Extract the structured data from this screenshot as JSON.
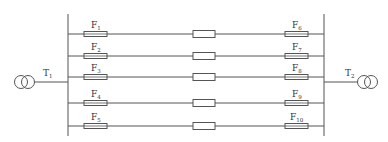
{
  "diagram": {
    "type": "electrical-single-line",
    "colors": {
      "line": "#555555",
      "text": "#333333",
      "background": "#ffffff"
    },
    "transformers": [
      {
        "id": "T1",
        "label": "T",
        "sub": "1",
        "side": "left"
      },
      {
        "id": "T2",
        "label": "T",
        "sub": "2",
        "side": "right"
      }
    ],
    "feeders": [
      {
        "left_fuse": {
          "label": "F",
          "sub": "1"
        },
        "right_fuse": {
          "label": "F",
          "sub": "6"
        }
      },
      {
        "left_fuse": {
          "label": "F",
          "sub": "2"
        },
        "right_fuse": {
          "label": "F",
          "sub": "7"
        }
      },
      {
        "left_fuse": {
          "label": "F",
          "sub": "3"
        },
        "right_fuse": {
          "label": "F",
          "sub": "8"
        }
      },
      {
        "left_fuse": {
          "label": "F",
          "sub": "4"
        },
        "right_fuse": {
          "label": "F",
          "sub": "9"
        }
      },
      {
        "left_fuse": {
          "label": "F",
          "sub": "5"
        },
        "right_fuse": {
          "label": "F",
          "sub": "10"
        }
      }
    ]
  }
}
